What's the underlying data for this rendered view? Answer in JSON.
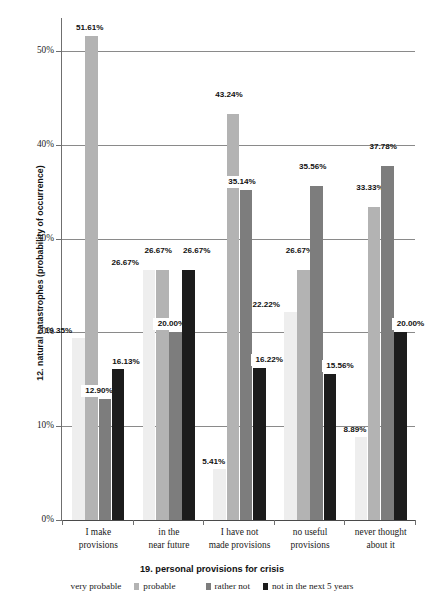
{
  "chart_data": {
    "type": "bar",
    "title": "",
    "xlabel": "19. personal provisions for crisis",
    "ylabel": "12. natural catastrophes (probability of occurrence)",
    "categories": [
      "I make provisions",
      "in the near future",
      "I have not made provisions",
      "no useful provisions",
      "never thought about it"
    ],
    "category_lines": [
      [
        "I make",
        "provisions"
      ],
      [
        "in the",
        "near future"
      ],
      [
        "I have not",
        "made provisions"
      ],
      [
        "no useful",
        "provisions"
      ],
      [
        "never thought",
        "about it"
      ]
    ],
    "series": [
      {
        "name": "very probable",
        "color": "#eeeeee",
        "values": [
          19.35,
          26.67,
          5.41,
          22.22,
          8.89
        ],
        "labels": [
          "19.35%",
          "26.67%",
          "5.41%",
          "22.22%",
          "8.89%"
        ]
      },
      {
        "name": "probable",
        "color": "#b3b3b3",
        "values": [
          51.61,
          26.67,
          43.24,
          26.67,
          33.33
        ],
        "labels": [
          "51.61%",
          "26.67%",
          "43.24%",
          "26.67%",
          "33.33%"
        ]
      },
      {
        "name": "rather not",
        "color": "#7d7d7d",
        "values": [
          12.9,
          20.0,
          35.14,
          35.56,
          37.78
        ],
        "labels": [
          "12.90%",
          "20.00%",
          "35.14%",
          "35.56%",
          "37.78%"
        ]
      },
      {
        "name": "not in the next 5 years",
        "color": "#1c1c1c",
        "values": [
          16.13,
          26.67,
          16.22,
          15.56,
          20.0
        ],
        "labels": [
          "16.13%",
          "26.67%",
          "16.22%",
          "15.56%",
          "20.00%"
        ]
      }
    ],
    "ylim": [
      0,
      53.5
    ],
    "yticks": [
      0,
      10,
      20,
      30,
      40,
      50
    ],
    "ytick_labels": [
      "0%",
      "10%",
      "20%",
      "30%",
      "40%",
      "50%"
    ],
    "grid": true,
    "legend_position": "bottom",
    "legend_entries": [
      "very probable",
      "probable",
      "rather not",
      "not in the next 5 years"
    ]
  }
}
